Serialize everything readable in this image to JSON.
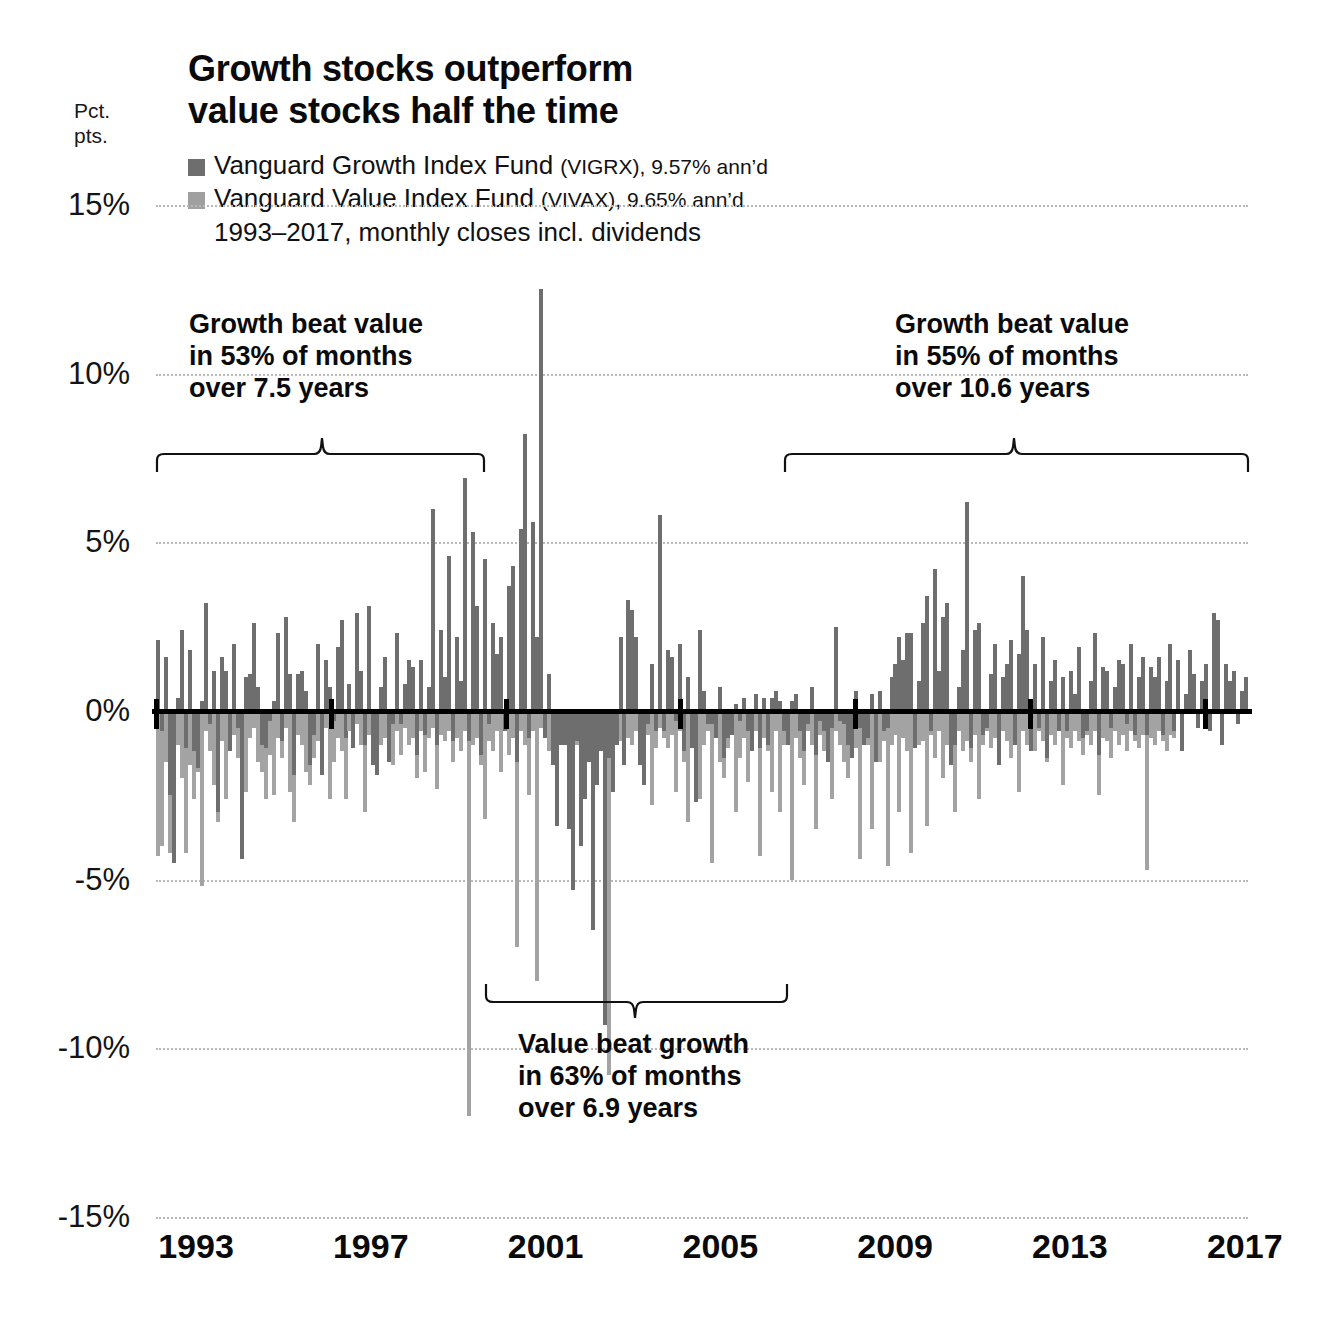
{
  "axis_unit": {
    "line1": "Pct.",
    "line2": "pts."
  },
  "title": {
    "line1": "Growth stocks outperform",
    "line2": "value stocks half the time"
  },
  "legend": {
    "growth": {
      "name": "Vanguard Growth Index Fund",
      "detail": "(VIGRX), 9.57% ann’d",
      "color": "#6e6e6e"
    },
    "value": {
      "name": "Vanguard Value Index Fund",
      "detail": "(VIVAX), 9.65% ann’d",
      "color": "#a0a0a0"
    },
    "note": "1993–2017, monthly closes incl. dividends"
  },
  "annotations": [
    {
      "id": "left",
      "line1": "Growth beat value",
      "line2": "in 53% of months",
      "line3": "over 7.5 years"
    },
    {
      "id": "middle",
      "line1": "Value beat growth",
      "line2": "in 63% of months",
      "line3": "over 6.9 years"
    },
    {
      "id": "right",
      "line1": "Growth beat value",
      "line2": "in 55% of months",
      "line3": "over 10.6 years"
    }
  ],
  "chart_data": {
    "type": "bar",
    "title": "Growth stocks outperform value stocks half the time",
    "subtitle": "1993–2017, monthly closes incl. dividends",
    "xlabel": "",
    "ylabel": "Pct. pts.",
    "ylim": [
      -15,
      15
    ],
    "yticks": [
      15,
      10,
      5,
      0,
      -5,
      -10,
      -15
    ],
    "ytick_labels": [
      "15%",
      "10%",
      "5%",
      "0%",
      "-5%",
      "-10%",
      "-15%"
    ],
    "xticks": [
      1993,
      1997,
      2001,
      2005,
      2009,
      2013,
      2017
    ],
    "xtick_labels": [
      "1993",
      "1997",
      "2001",
      "2005",
      "2009",
      "2013",
      "2017"
    ],
    "grid": true,
    "legend_position": "top-left",
    "series": [
      {
        "name": "Vanguard Growth Index Fund",
        "color": "#6e6e6e",
        "values": [
          2.1,
          -0.6,
          1.6,
          -2.5,
          -4.5,
          0.4,
          2.4,
          -1.1,
          1.8,
          -1.2,
          -1.7,
          0.3,
          3.2,
          -0.4,
          1.2,
          -3.0,
          1.6,
          1.2,
          -1.2,
          2.0,
          -0.5,
          -4.4,
          1.0,
          1.1,
          2.6,
          0.7,
          -1.0,
          -1.1,
          -0.3,
          0.3,
          2.3,
          -0.9,
          2.8,
          1.1,
          -1.9,
          1.1,
          1.2,
          0.6,
          -1.6,
          -0.7,
          2.0,
          -1.9,
          1.5,
          0.7,
          -0.3,
          1.9,
          2.7,
          -0.8,
          0.8,
          -1.1,
          2.9,
          1.2,
          -1.0,
          3.1,
          -1.6,
          -1.9,
          0.7,
          1.6,
          -1.5,
          -0.4,
          2.3,
          -0.4,
          0.8,
          1.5,
          1.3,
          -1.3,
          1.5,
          -0.7,
          0.7,
          6.0,
          -1.0,
          2.4,
          1.0,
          4.6,
          -0.9,
          2.2,
          0.9,
          6.9,
          -0.9,
          5.3,
          3.1,
          -1.3,
          4.5,
          -0.4,
          2.6,
          1.7,
          2.2,
          -0.6,
          3.7,
          4.3,
          -1.5,
          5.4,
          8.2,
          -0.8,
          5.6,
          2.2,
          12.5,
          -0.8,
          1.1,
          -1.6,
          -3.4,
          -1.0,
          -1.0,
          -3.5,
          -5.3,
          -0.9,
          -4.0,
          -2.6,
          -1.5,
          -6.5,
          -2.2,
          -1.2,
          -9.3,
          -1.4,
          -2.4,
          -1.0,
          2.2,
          -1.6,
          3.3,
          3.0,
          2.2,
          -1.6,
          -2.2,
          -0.4,
          1.4,
          -0.6,
          5.8,
          -0.6,
          1.8,
          1.6,
          -0.3,
          2.0,
          -1.2,
          1.0,
          -1.1,
          -2.7,
          2.4,
          0.6,
          -0.4,
          -0.4,
          -0.8,
          0.7,
          -1.4,
          -0.8,
          -0.7,
          0.2,
          -0.3,
          0.4,
          -0.6,
          -1.2,
          0.5,
          -1.1,
          0.4,
          -1.0,
          0.4,
          0.6,
          0.3,
          -0.6,
          -1.0,
          0.3,
          0.5,
          -0.6,
          -1.2,
          -0.4,
          0.7,
          -1.3,
          -0.3,
          -0.6,
          -1.5,
          -0.5,
          2.5,
          -0.3,
          -0.4,
          -1.0,
          -1.4,
          0.6,
          -0.5,
          -1.0,
          -0.8,
          0.5,
          -1.5,
          0.6,
          -0.6,
          -0.5,
          1.0,
          1.4,
          2.2,
          1.5,
          2.3,
          2.3,
          -1.1,
          0.9,
          2.6,
          3.4,
          -0.6,
          4.2,
          1.2,
          2.8,
          3.2,
          -1.6,
          -1.0,
          0.7,
          1.8,
          6.2,
          -1.1,
          2.4,
          2.6,
          -0.7,
          -0.5,
          1.1,
          2.0,
          -1.6,
          1.0,
          1.4,
          2.1,
          -1.0,
          1.7,
          4.0,
          2.4,
          -1.2,
          1.4,
          -0.5,
          2.2,
          -1.4,
          0.9,
          1.5,
          -0.6,
          1.0,
          -0.6,
          1.2,
          0.5,
          1.9,
          -0.8,
          -0.6,
          0.9,
          2.3,
          -1.3,
          1.3,
          1.2,
          -0.5,
          0.7,
          1.5,
          1.4,
          -0.4,
          2.0,
          -0.7,
          1.0,
          1.6,
          -0.7,
          1.3,
          1.0,
          1.6,
          -0.7,
          0.9,
          2.0,
          -0.6,
          1.5,
          -1.2,
          0.5,
          1.8,
          1.1,
          -0.5,
          0.9,
          1.4,
          -0.6,
          2.9,
          2.7,
          -1.0,
          1.4,
          0.9,
          1.2,
          -0.4,
          0.6,
          1.0
        ]
      },
      {
        "name": "Vanguard Value Index Fund",
        "color": "#a3a3a3",
        "values": [
          -4.3,
          -4.0,
          -1.5,
          -4.2,
          -3.5,
          -1.0,
          -2.0,
          -4.2,
          -1.6,
          -2.6,
          -1.8,
          -5.2,
          -0.6,
          -1.2,
          -2.2,
          -3.3,
          -0.9,
          -2.6,
          -1.1,
          -0.7,
          -1.4,
          -1.5,
          -2.4,
          -0.8,
          -0.5,
          -1.5,
          -1.8,
          -2.6,
          -1.3,
          -2.5,
          -0.8,
          -1.4,
          -0.5,
          -2.4,
          -3.3,
          -0.7,
          -1.0,
          -1.8,
          -2.2,
          -1.4,
          -0.9,
          -1.2,
          -0.5,
          -2.6,
          -1.5,
          -0.8,
          -1.2,
          -2.6,
          -0.6,
          -1.1,
          -0.4,
          -1.0,
          -3.0,
          -0.7,
          -1.5,
          -0.7,
          -1.0,
          -0.8,
          -0.7,
          -1.6,
          -0.6,
          -1.3,
          -0.5,
          -1.0,
          -0.8,
          -2.0,
          -0.6,
          -1.8,
          -0.8,
          -0.5,
          -2.3,
          -0.7,
          -0.9,
          -0.6,
          -1.5,
          -0.8,
          -1.2,
          -0.6,
          -12.0,
          -1.0,
          -0.8,
          -1.6,
          -3.2,
          -0.9,
          -1.2,
          -0.6,
          -1.8,
          -0.5,
          -1.3,
          -0.8,
          -7.0,
          -0.6,
          -1.0,
          -2.5,
          -0.6,
          -8.0,
          -0.5,
          -0.7,
          -1.2,
          -0.8,
          -0.6,
          -1.0,
          -0.5,
          -0.8,
          -0.6,
          -1.0,
          -0.5,
          -0.7,
          -0.6,
          -0.4,
          -0.5,
          -0.8,
          -0.6,
          -10.8,
          -0.6,
          -0.5,
          -0.9,
          -0.7,
          -0.8,
          -1.0,
          -0.6,
          -1.1,
          -0.9,
          -0.7,
          -2.8,
          -1.1,
          -0.5,
          -0.8,
          -1.1,
          -0.7,
          -2.4,
          -0.6,
          -1.5,
          -3.3,
          -0.7,
          -1.2,
          -2.6,
          -1.0,
          -0.6,
          -4.5,
          -0.8,
          -1.5,
          -2.0,
          -1.1,
          -0.6,
          -3.0,
          -1.4,
          -0.8,
          -2.1,
          -1.0,
          -0.6,
          -4.3,
          -0.8,
          -1.2,
          -2.4,
          -0.6,
          -3.0,
          -1.0,
          -0.7,
          -5.0,
          -0.8,
          -1.4,
          -2.2,
          -0.6,
          -1.0,
          -3.5,
          -0.7,
          -1.2,
          -0.9,
          -2.6,
          -0.6,
          -1.0,
          -1.5,
          -2.0,
          -0.7,
          -1.1,
          -4.4,
          -0.8,
          -1.0,
          -3.5,
          -0.6,
          -1.5,
          -0.9,
          -4.6,
          -1.0,
          -0.7,
          -3.0,
          -0.8,
          -1.2,
          -4.2,
          -0.6,
          -1.0,
          -0.9,
          -3.4,
          -0.7,
          -1.4,
          -0.6,
          -2.0,
          -1.0,
          -0.8,
          -3.0,
          -0.6,
          -1.2,
          -0.9,
          -1.5,
          -0.7,
          -2.6,
          -1.0,
          -0.6,
          -1.1,
          -0.8,
          -1.3,
          -0.6,
          -0.9,
          -1.4,
          -0.7,
          -2.4,
          -0.6,
          -1.0,
          -0.8,
          -1.2,
          -0.6,
          -0.9,
          -1.5,
          -0.7,
          -1.0,
          -0.6,
          -2.2,
          -0.8,
          -1.1,
          -0.6,
          -0.9,
          -1.3,
          -0.7,
          -1.0,
          -0.6,
          -2.5,
          -0.8,
          -0.9,
          -1.4,
          -0.6,
          -1.0,
          -0.7,
          -1.2,
          -0.6,
          -0.9,
          -1.1,
          -0.7,
          -4.7,
          -0.8,
          -1.0,
          -0.6,
          -0.9,
          -1.2,
          -0.7,
          -0.8
        ]
      }
    ]
  }
}
